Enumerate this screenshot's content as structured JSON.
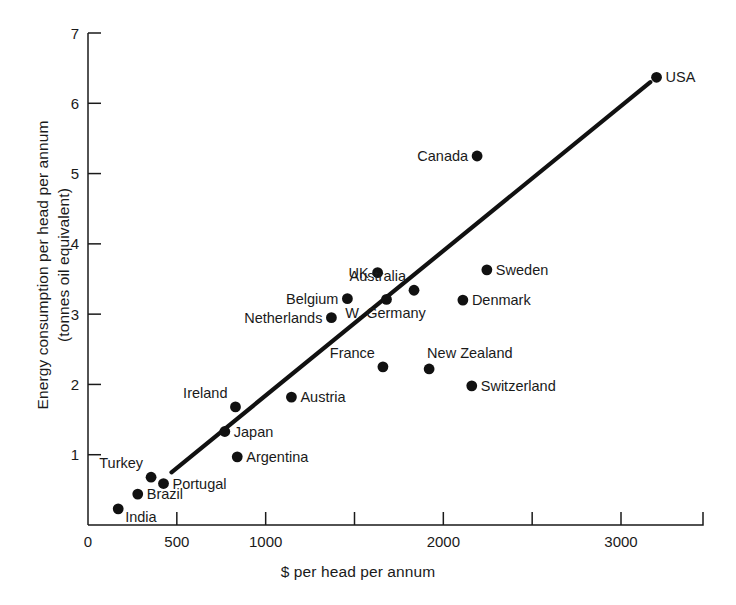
{
  "chart_data": {
    "type": "scatter",
    "title": "",
    "xlabel": "$ per head per annum",
    "ylabel_line1": "Energy consumption per head per annum",
    "ylabel_line2": "(tonnes oil equivalent)",
    "xlim": [
      0,
      3500
    ],
    "ylim": [
      0,
      7
    ],
    "grid": false,
    "legend": null,
    "x_tick_labels": [
      "0",
      "500",
      "1000",
      "2000",
      "3000"
    ],
    "x_tick_values": [
      0,
      500,
      1000,
      2000,
      3000
    ],
    "x_minor_tick_values": [
      1500,
      2500
    ],
    "y_tick_labels": [
      "1",
      "2",
      "3",
      "4",
      "5",
      "6",
      "7"
    ],
    "y_tick_values": [
      1,
      2,
      3,
      4,
      5,
      6,
      7
    ],
    "trend_line": {
      "label": "fitted line",
      "x_start": 470,
      "y_start": 0.75,
      "x_end": 3165,
      "y_end": 6.3
    },
    "points": [
      {
        "label": "USA",
        "x": 3200,
        "y": 6.37,
        "label_pos": "right"
      },
      {
        "label": "Canada",
        "x": 2190,
        "y": 5.25,
        "label_pos": "left"
      },
      {
        "label": "Sweden",
        "x": 2245,
        "y": 3.63,
        "label_pos": "right"
      },
      {
        "label": "UK",
        "x": 1630,
        "y": 3.59,
        "label_pos": "left"
      },
      {
        "label": "Australia",
        "x": 1835,
        "y": 3.34,
        "label_pos": "above-left"
      },
      {
        "label": "Denmark",
        "x": 2110,
        "y": 3.2,
        "label_pos": "right"
      },
      {
        "label": "Belgium",
        "x": 1460,
        "y": 3.22,
        "label_pos": "left"
      },
      {
        "label": "W. Germany",
        "x": 1680,
        "y": 3.21,
        "label_pos": "below"
      },
      {
        "label": "Netherlands",
        "x": 1370,
        "y": 2.95,
        "label_pos": "left"
      },
      {
        "label": "France",
        "x": 1660,
        "y": 2.25,
        "label_pos": "above-left"
      },
      {
        "label": "New Zealand",
        "x": 1920,
        "y": 2.22,
        "label_pos": "above-right"
      },
      {
        "label": "Switzerland",
        "x": 2160,
        "y": 1.98,
        "label_pos": "right"
      },
      {
        "label": "Austria",
        "x": 1145,
        "y": 1.82,
        "label_pos": "right"
      },
      {
        "label": "Ireland",
        "x": 830,
        "y": 1.68,
        "label_pos": "above-left"
      },
      {
        "label": "Japan",
        "x": 770,
        "y": 1.33,
        "label_pos": "right"
      },
      {
        "label": "Argentina",
        "x": 840,
        "y": 0.97,
        "label_pos": "right"
      },
      {
        "label": "Turkey",
        "x": 355,
        "y": 0.68,
        "label_pos": "above-left"
      },
      {
        "label": "Portugal",
        "x": 425,
        "y": 0.59,
        "label_pos": "right"
      },
      {
        "label": "Brazil",
        "x": 280,
        "y": 0.44,
        "label_pos": "right"
      },
      {
        "label": "India",
        "x": 170,
        "y": 0.23,
        "label_pos": "below-right"
      }
    ]
  }
}
